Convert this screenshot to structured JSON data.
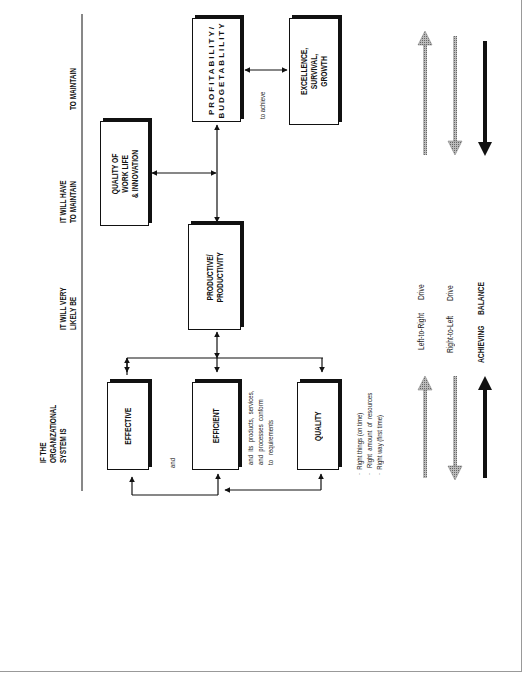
{
  "columns": {
    "col1": "IF THE\nORGANIZATIONAL\nSYSTEM IS",
    "col2": "IT WILL VERY\nLIKELY BE",
    "col3": "IT WILL HAVE\nTO MAINTAIN",
    "col4": "TO MAINTAIN"
  },
  "boxes": {
    "effective": "EFFECTIVE",
    "efficient": "EFFICIENT",
    "quality": "QUALITY",
    "productive": "PRODUCTIVE/\nPRODUCTIVITY",
    "qowl": "QUALITY OF\nWORK LIFE\n& INNOVATION",
    "profitability": "PROFITABILITY/\nBUDGETABLILITY",
    "excellence": "EXCELLENCE,\nSURVIVAL,\nGROWTH"
  },
  "annotations": {
    "and": "and",
    "conform": "and  its  products,  services,\nand  processes  conform\nto   requirements",
    "to_achieve": "to achieve",
    "bullets": "·  Right things (on time)\n·   Right  amount  of  resources\n·  Right way (first time)"
  },
  "legend": {
    "ltr": "Left-to-Right",
    "ltr_drive": "Drive",
    "rtl": "Right-to-Left",
    "rtl_drive": "Drive",
    "achieving": "ACHIEVING",
    "balance": "BALANCE"
  },
  "colors": {
    "line": "#111111",
    "hatched": "#9a9a9a",
    "shadow": "#111111"
  }
}
